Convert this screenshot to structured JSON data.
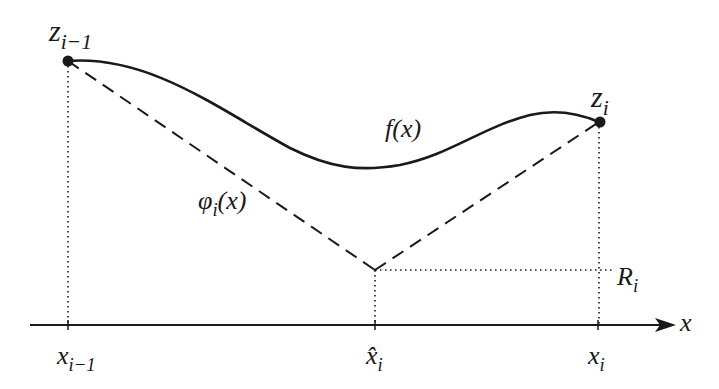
{
  "diagram": {
    "type": "function-approximation-sketch",
    "colors": {
      "stroke": "#1a1a1a",
      "background": "#ffffff"
    },
    "points": {
      "z_prev": {
        "label_base": "z",
        "label_sub": "i−1",
        "x": 68,
        "y": 61
      },
      "z_cur": {
        "label_base": "z",
        "label_sub": "i",
        "x": 600,
        "y": 122
      },
      "vertex": {
        "x": 375,
        "y": 270
      }
    },
    "curve_label": "f(x)",
    "phi_label_base": "φ",
    "phi_label_sub": "i",
    "phi_label_tail": "(x)",
    "axis": {
      "label": "x",
      "y": 325,
      "ticks": [
        {
          "base": "x",
          "sub": "i−1",
          "x": 68
        },
        {
          "base": "x̂",
          "sub": "i",
          "x": 375
        },
        {
          "base": "x",
          "sub": "i",
          "x": 598
        }
      ]
    },
    "level_label_base": "R",
    "level_label_sub": "i"
  }
}
